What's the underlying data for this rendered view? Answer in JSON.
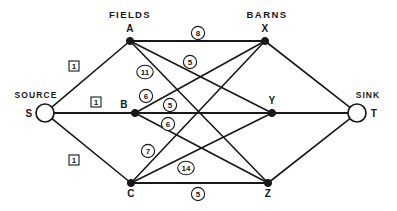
{
  "figure": {
    "type": "flow-network-diagram",
    "title_groups": {
      "left_group_label": "FIELDS",
      "right_group_label": "BARNS",
      "source_label": "SOURCE",
      "sink_label": "SINK"
    }
  },
  "nodes": [
    {
      "id": "S",
      "label": "S",
      "x": 45,
      "y": 113,
      "shape": "open-circle",
      "radius": 9,
      "label_dx": -16,
      "label_dy": 4
    },
    {
      "id": "A",
      "label": "A",
      "x": 130,
      "y": 41,
      "shape": "dot",
      "radius": 3.6,
      "label_dx": 0,
      "label_dy": -9
    },
    {
      "id": "B",
      "label": "B",
      "x": 135,
      "y": 113,
      "shape": "dot",
      "radius": 3.6,
      "label_dx": -11,
      "label_dy": -5
    },
    {
      "id": "C",
      "label": "C",
      "x": 131,
      "y": 183,
      "shape": "dot",
      "radius": 3.6,
      "label_dx": 0,
      "label_dy": 14
    },
    {
      "id": "X",
      "label": "X",
      "x": 265,
      "y": 41,
      "shape": "dot",
      "radius": 3.6,
      "label_dx": 0,
      "label_dy": -9
    },
    {
      "id": "Y",
      "label": "Y",
      "x": 272,
      "y": 113,
      "shape": "dot",
      "radius": 3.6,
      "label_dx": 0,
      "label_dy": -9
    },
    {
      "id": "Z",
      "label": "Z",
      "x": 268,
      "y": 183,
      "shape": "dot",
      "radius": 3.6,
      "label_dx": 0,
      "label_dy": 14
    },
    {
      "id": "T",
      "label": "T",
      "x": 357,
      "y": 113,
      "shape": "open-circle",
      "radius": 9,
      "label_dx": 17,
      "label_dy": 4
    }
  ],
  "edges": [
    {
      "from": "S",
      "to": "A",
      "capacity": "1",
      "marker": "box",
      "lx": 74,
      "ly": 66,
      "thick": false
    },
    {
      "from": "S",
      "to": "B",
      "capacity": "1",
      "marker": "box",
      "lx": 96,
      "ly": 102,
      "thick": true
    },
    {
      "from": "S",
      "to": "C",
      "capacity": "1",
      "marker": "box",
      "lx": 74,
      "ly": 160,
      "thick": false
    },
    {
      "from": "A",
      "to": "X",
      "capacity": "8",
      "marker": "circle",
      "lx": 198,
      "ly": 33,
      "thick": true
    },
    {
      "from": "A",
      "to": "Y",
      "capacity": "5",
      "marker": "circle",
      "lx": 190,
      "ly": 62,
      "thick": false
    },
    {
      "from": "A",
      "to": "Z",
      "capacity": "11",
      "marker": "circle",
      "lx": 145,
      "ly": 72,
      "thick": false
    },
    {
      "from": "B",
      "to": "X",
      "capacity": "6",
      "marker": "circle",
      "lx": 146,
      "ly": 96,
      "thick": false
    },
    {
      "from": "B",
      "to": "Y",
      "capacity": "5",
      "marker": "circle",
      "lx": 170,
      "ly": 105,
      "thick": true
    },
    {
      "from": "B",
      "to": "Z",
      "capacity": "6",
      "marker": "circle",
      "lx": 168,
      "ly": 124,
      "thick": false
    },
    {
      "from": "C",
      "to": "X",
      "capacity": "7",
      "marker": "circle",
      "lx": 148,
      "ly": 151,
      "thick": false
    },
    {
      "from": "C",
      "to": "Y",
      "capacity": "14",
      "marker": "circle",
      "lx": 186,
      "ly": 168,
      "thick": false
    },
    {
      "from": "C",
      "to": "Z",
      "capacity": "5",
      "marker": "circle",
      "lx": 198,
      "ly": 194,
      "thick": true
    },
    {
      "from": "X",
      "to": "T",
      "capacity": "",
      "marker": "none",
      "lx": 0,
      "ly": 0,
      "thick": false
    },
    {
      "from": "Y",
      "to": "T",
      "capacity": "",
      "marker": "none",
      "lx": 0,
      "ly": 0,
      "thick": true
    },
    {
      "from": "Z",
      "to": "T",
      "capacity": "",
      "marker": "none",
      "lx": 0,
      "ly": 0,
      "thick": false
    }
  ],
  "group_headings": [
    {
      "text": "FIELDS",
      "x": 130,
      "y": 18
    },
    {
      "text": "BARNS",
      "x": 267,
      "y": 18
    }
  ],
  "end_headings": [
    {
      "text": "SOURCE",
      "x": 36,
      "y": 98,
      "anchor": "middle"
    },
    {
      "text": "SINK",
      "x": 368,
      "y": 98,
      "anchor": "middle"
    }
  ],
  "colors": {
    "ink": "#17181a",
    "background": "#ffffff"
  }
}
